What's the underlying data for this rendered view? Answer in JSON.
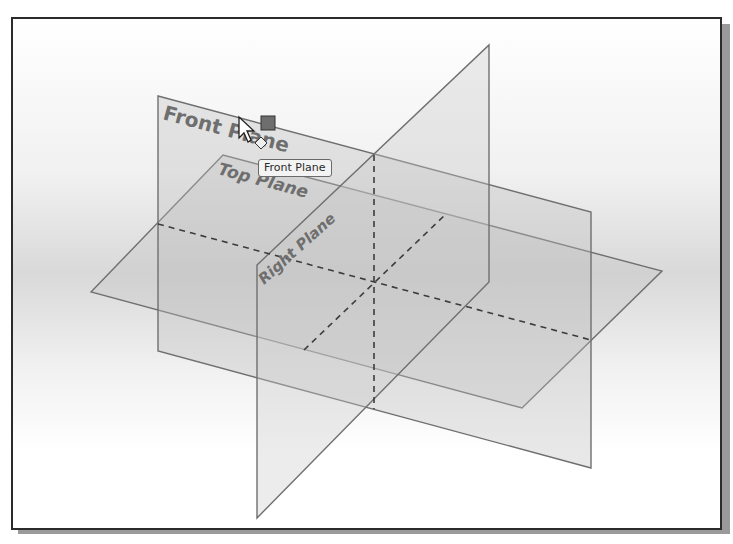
{
  "viewport": {
    "background_top": "#ffffff",
    "background_mid": "#d9d9d9",
    "frame_color": "#2b2b2b"
  },
  "planes": {
    "front": {
      "label": "Front Plane",
      "label_visible": "Front Pl ne"
    },
    "top": {
      "label": "Top Plane"
    },
    "right": {
      "label": "Right Plane"
    }
  },
  "tooltip": {
    "text": "Front Plane"
  },
  "cursor": {
    "icon": "arrow-pointer-icon",
    "badge": "plane-select-icon"
  },
  "colors": {
    "plane_edge": "#6f6f6f",
    "plane_fill": "#bdbdbd",
    "dashed_axis": "#3c3c3c",
    "label_text": "#6e6e6e"
  }
}
